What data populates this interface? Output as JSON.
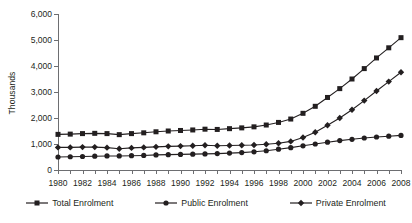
{
  "chart_data": {
    "type": "line",
    "title": "",
    "xlabel": "",
    "ylabel": "Thousands",
    "ylim": [
      0,
      6000
    ],
    "ytick_labels": [
      "0",
      "1,000",
      "2,000",
      "3,000",
      "4,000",
      "5,000",
      "6,000"
    ],
    "ytick_values": [
      0,
      1000,
      2000,
      3000,
      4000,
      5000,
      6000
    ],
    "grid": false,
    "legend_position": "bottom",
    "x": [
      1980,
      1981,
      1982,
      1983,
      1984,
      1985,
      1986,
      1987,
      1988,
      1989,
      1990,
      1991,
      1992,
      1993,
      1994,
      1995,
      1996,
      1997,
      1998,
      1999,
      2000,
      2001,
      2002,
      2003,
      2004,
      2005,
      2006,
      2007,
      2008
    ],
    "xtick_labels": [
      "1980",
      "1982",
      "1984",
      "1986",
      "1988",
      "1990",
      "1992",
      "1994",
      "1996",
      "1998",
      "2000",
      "2002",
      "2004",
      "2006",
      "2008"
    ],
    "xtick_values": [
      1980,
      1982,
      1984,
      1986,
      1988,
      1990,
      1992,
      1994,
      1996,
      1998,
      2000,
      2002,
      2004,
      2006,
      2008
    ],
    "series": [
      {
        "name": "Total Enrolment",
        "marker": "square",
        "values": [
          1370,
          1380,
          1400,
          1410,
          1400,
          1360,
          1400,
          1430,
          1470,
          1500,
          1520,
          1540,
          1570,
          1560,
          1590,
          1620,
          1660,
          1730,
          1830,
          1960,
          2180,
          2450,
          2790,
          3130,
          3500,
          3900,
          4310,
          4700,
          5090
        ]
      },
      {
        "name": "Public Enrolment",
        "marker": "circle",
        "values": [
          500,
          510,
          520,
          530,
          540,
          540,
          550,
          560,
          580,
          590,
          600,
          610,
          620,
          630,
          650,
          670,
          700,
          740,
          800,
          860,
          930,
          1000,
          1070,
          1130,
          1180,
          1230,
          1270,
          1300,
          1330
        ]
      },
      {
        "name": "Private Enrolment",
        "marker": "diamond",
        "values": [
          870,
          870,
          880,
          880,
          860,
          820,
          850,
          870,
          890,
          910,
          920,
          930,
          950,
          930,
          940,
          950,
          960,
          990,
          1030,
          1100,
          1250,
          1450,
          1720,
          2000,
          2320,
          2670,
          3040,
          3400,
          3760
        ]
      }
    ]
  },
  "legend": {
    "items": [
      {
        "label": "Total Enrolment",
        "marker": "square-marker-icon"
      },
      {
        "label": "Public Enrolment",
        "marker": "circle-marker-icon"
      },
      {
        "label": "Private Enrolment",
        "marker": "diamond-marker-icon"
      }
    ]
  },
  "colors": {
    "series": "#231f20",
    "axis": "#6d6e71",
    "background": "#ffffff"
  }
}
